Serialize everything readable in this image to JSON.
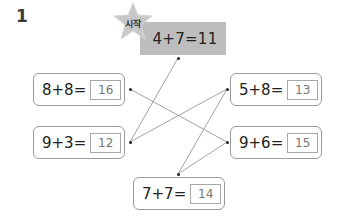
{
  "problem": {
    "number": "1"
  },
  "start": {
    "badge": "시작",
    "expression": "4+7=11"
  },
  "cards": [
    {
      "id": "left-top",
      "expression": "8+8=",
      "answer": "16"
    },
    {
      "id": "left-bottom",
      "expression": "9+3=",
      "answer": "12"
    },
    {
      "id": "right-top",
      "expression": "5+8=",
      "answer": "13"
    },
    {
      "id": "right-bottom",
      "expression": "9+6=",
      "answer": "15"
    },
    {
      "id": "bottom",
      "expression": "7+7=",
      "answer": "14"
    }
  ],
  "connections": [
    {
      "from": "start",
      "to": "left-bottom"
    },
    {
      "from": "left-bottom",
      "to": "right-top"
    },
    {
      "from": "right-top",
      "to": "bottom"
    },
    {
      "from": "bottom",
      "to": "right-bottom"
    },
    {
      "from": "right-bottom",
      "to": "left-top"
    }
  ],
  "colors": {
    "tape": "#bdbdbd",
    "star": "#c8c8c8",
    "border": "#9a9a9a",
    "line": "#888888"
  }
}
